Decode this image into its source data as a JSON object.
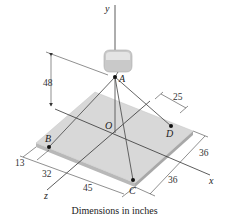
{
  "diagram": {
    "axes": {
      "x": "x",
      "y": "y",
      "z": "z"
    },
    "points": {
      "A": "A",
      "B": "B",
      "C": "C",
      "D": "D",
      "O": "O"
    },
    "dimensions": {
      "height_A": "48",
      "d_D_offset": "25",
      "right_upper": "36",
      "right_lower": "36",
      "left_13": "13",
      "left_32": "32",
      "left_45": "45"
    },
    "caption": "Dimensions in inches",
    "colors": {
      "plate": "#d9d9d9",
      "plate_edge": "#bdbdbd",
      "block": "#cfcfcf",
      "line": "#444444"
    }
  }
}
